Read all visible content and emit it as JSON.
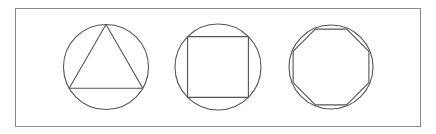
{
  "diagram": {
    "stroke_color": "#555555",
    "frame_color": "#8a8a8a",
    "background": "#ffffff",
    "figures": [
      {
        "name": "triangle-in-circle",
        "shape": "triangle",
        "sides": 3,
        "rotation_deg": -90
      },
      {
        "name": "square-in-circle",
        "shape": "square",
        "sides": 4,
        "rotation_deg": -45
      },
      {
        "name": "octagon-in-circle",
        "shape": "octagon",
        "sides": 8,
        "rotation_deg": -22.5
      }
    ]
  }
}
